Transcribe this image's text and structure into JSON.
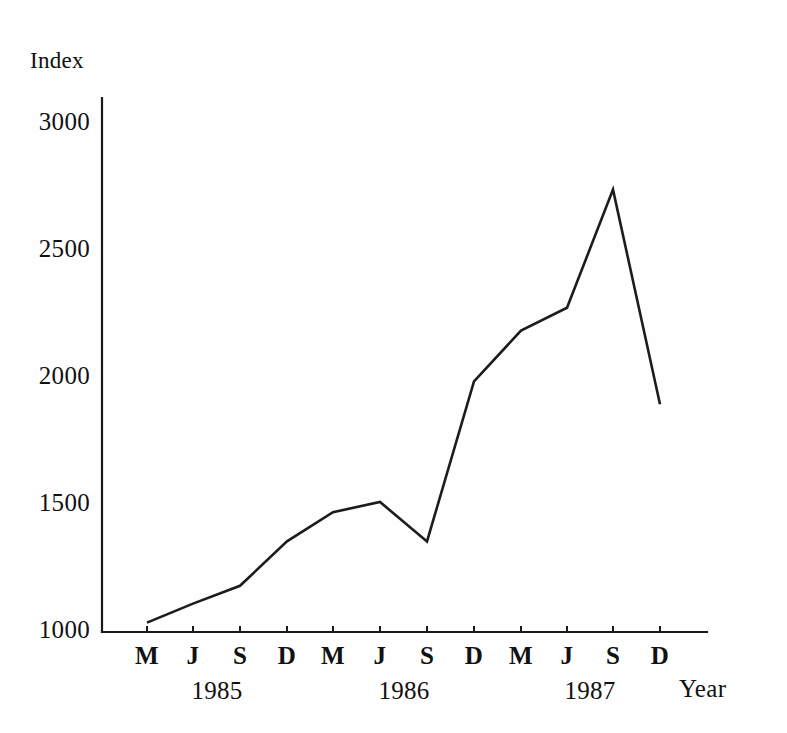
{
  "chart_data": {
    "type": "line",
    "title": "",
    "xlabel": "Year",
    "ylabel": "Index",
    "ylim": [
      1000,
      3000
    ],
    "grid": false,
    "legend": "none",
    "y_ticks": [
      1000,
      1500,
      2000,
      2500,
      3000
    ],
    "y_tick_labels": [
      "1000",
      "1500",
      "2000",
      "2500",
      "3000"
    ],
    "categories": [
      "M",
      "J",
      "S",
      "D",
      "M",
      "J",
      "S",
      "D",
      "M",
      "J",
      "S",
      "D"
    ],
    "x_group_labels": [
      "1985",
      "1986",
      "1987"
    ],
    "x_full_labels": [
      "M 1985",
      "J 1985",
      "S 1985",
      "D 1985",
      "M 1986",
      "J 1986",
      "S 1986",
      "D 1986",
      "M 1987",
      "J 1987",
      "S 1987",
      "D 1987"
    ],
    "series": [
      {
        "name": "Index",
        "values": [
          1025,
          1100,
          1170,
          1345,
          1460,
          1500,
          1345,
          1975,
          2175,
          2265,
          2730,
          1885
        ]
      }
    ],
    "line_color": "#1c1c1c"
  },
  "axis": {
    "y_title": "Index",
    "x_title": "Year"
  },
  "y_labels": {
    "t0": "1000",
    "t1": "1500",
    "t2": "2000",
    "t3": "2500",
    "t4": "3000"
  },
  "x_labels": {
    "m0": "M",
    "m1": "J",
    "m2": "S",
    "m3": "D",
    "m4": "M",
    "m5": "J",
    "m6": "S",
    "m7": "D",
    "m8": "M",
    "m9": "J",
    "m10": "S",
    "m11": "D"
  },
  "year_labels": {
    "y0": "1985",
    "y1": "1986",
    "y2": "1987"
  }
}
